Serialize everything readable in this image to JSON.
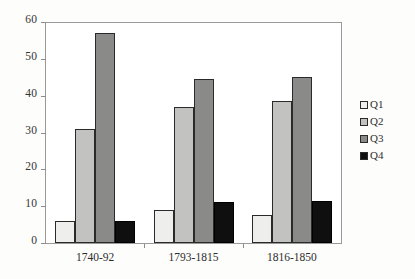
{
  "chart_data": {
    "type": "bar",
    "title": "",
    "subtitle": "",
    "xlabel": "",
    "ylabel": "",
    "categories": [
      "1740-92",
      "1793-1815",
      "1816-1850"
    ],
    "series": [
      {
        "name": "Q1",
        "color": "#eeeeec",
        "values": [
          6,
          9,
          7.5
        ]
      },
      {
        "name": "Q2",
        "color": "#c2c2c0",
        "values": [
          31,
          37,
          38.5
        ]
      },
      {
        "name": "Q3",
        "color": "#8a8a88",
        "values": [
          57,
          44.5,
          45
        ]
      },
      {
        "name": "Q4",
        "color": "#100f0f",
        "values": [
          6,
          11,
          11.5
        ]
      }
    ],
    "ylim": [
      0,
      60
    ],
    "ytick_labels": [
      "60",
      "50",
      "40",
      "30",
      "20",
      "10",
      "0"
    ],
    "ytick_values": [
      60,
      50,
      40,
      30,
      20,
      10,
      0
    ],
    "grid": false,
    "legend_position": "right",
    "legend_entries": [
      "Q1",
      "Q2",
      "Q3",
      "Q4"
    ]
  }
}
